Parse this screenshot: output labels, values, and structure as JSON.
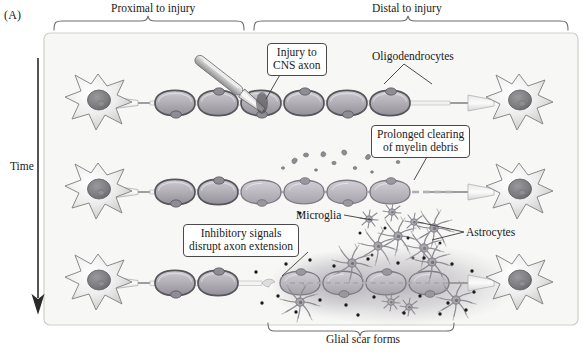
{
  "figure": {
    "panel_label": "(A)",
    "time_axis_label": "Time",
    "top_brackets": [
      {
        "label": "Proximal to injury"
      },
      {
        "label": "Distal to injury"
      }
    ],
    "bottom_brackets": [
      {
        "label": "Glial scar forms"
      }
    ],
    "callouts": [
      {
        "id": "injury",
        "line1": "Injury to",
        "line2": "CNS axon"
      },
      {
        "id": "clearing",
        "line1": "Prolonged clearing",
        "line2": "of myelin debris"
      },
      {
        "id": "inhibitory",
        "line1": "Inhibitory signals",
        "line2": "disrupt axon extension"
      }
    ],
    "plain_labels": [
      {
        "id": "oligodendrocytes",
        "text": "Oligodendrocytes"
      },
      {
        "id": "microglia",
        "text": "Microglia"
      },
      {
        "id": "astrocytes",
        "text": "Astrocytes"
      }
    ],
    "colors": {
      "panel_fill": "#f7f7f5",
      "panel_border": "#c8c8c4",
      "ink": "#1a1a1a",
      "myelin_outline": "#58585a",
      "myelin_fill": "#b9b6bc",
      "soma_fill": "#efefef",
      "nucleus": "#7c7c80",
      "debris": "#8e8b90",
      "scar": "#b2b0b4",
      "dots": "#1c1c1c"
    },
    "rows": [
      {
        "id": "row-1-intact-injury",
        "stage": "injury"
      },
      {
        "id": "row-2-degeneration",
        "stage": "clearing"
      },
      {
        "id": "row-3-glial-scar",
        "stage": "scar"
      }
    ]
  }
}
